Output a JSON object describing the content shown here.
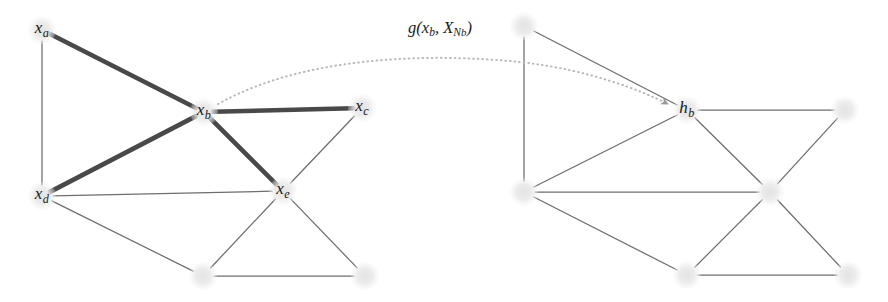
{
  "figure": {
    "title_caption": "",
    "background_color": "#ffffff",
    "node_fill_color": "#e8e8e8",
    "edge_color": "#555555",
    "highlight_edge_color": "#3a3a3a",
    "arrow_color": "#b8b8b8",
    "label_color": "#181818"
  },
  "annotation": {
    "formula_plain": "g(x_b, X_{N_b})",
    "g": "g",
    "open_paren": "(",
    "x": "x",
    "sub_b1": "b",
    "comma": ", ",
    "X": "X",
    "cal_N": "N",
    "sub_b2": "b",
    "close_paren": ")",
    "position": {
      "x": 440,
      "y": 28
    }
  },
  "left_graph": {
    "name": "input-graph",
    "nodes": [
      {
        "id": "xa",
        "label_base": "x",
        "label_sub": "a",
        "labeled": true,
        "x": 42,
        "y": 30,
        "r": 14
      },
      {
        "id": "xb",
        "label_base": "x",
        "label_sub": "b",
        "labeled": true,
        "x": 204,
        "y": 112,
        "r": 14
      },
      {
        "id": "xc",
        "label_base": "x",
        "label_sub": "c",
        "labeled": true,
        "x": 362,
        "y": 108,
        "r": 14
      },
      {
        "id": "xd",
        "label_base": "x",
        "label_sub": "d",
        "labeled": true,
        "x": 42,
        "y": 196,
        "r": 14
      },
      {
        "id": "xe",
        "label_base": "x",
        "label_sub": "e",
        "labeled": true,
        "x": 283,
        "y": 191,
        "r": 14
      },
      {
        "id": "u1",
        "label_base": "",
        "label_sub": "",
        "labeled": false,
        "x": 203,
        "y": 276,
        "r": 14
      },
      {
        "id": "u2",
        "label_base": "",
        "label_sub": "",
        "labeled": false,
        "x": 365,
        "y": 276,
        "r": 14
      }
    ],
    "edges": [
      {
        "from": "xa",
        "to": "xd",
        "highlight": false
      },
      {
        "from": "xa",
        "to": "xb",
        "highlight": true
      },
      {
        "from": "xd",
        "to": "xb",
        "highlight": true
      },
      {
        "from": "xb",
        "to": "xc",
        "highlight": true
      },
      {
        "from": "xb",
        "to": "xe",
        "highlight": true
      },
      {
        "from": "xd",
        "to": "xe",
        "highlight": false
      },
      {
        "from": "xc",
        "to": "xe",
        "highlight": false
      },
      {
        "from": "xd",
        "to": "u1",
        "highlight": false
      },
      {
        "from": "u1",
        "to": "xe",
        "highlight": false
      },
      {
        "from": "xe",
        "to": "u2",
        "highlight": false
      },
      {
        "from": "u1",
        "to": "u2",
        "highlight": false
      }
    ]
  },
  "right_graph": {
    "name": "output-embedding-graph",
    "nodes": [
      {
        "id": "ra",
        "label_base": "",
        "label_sub": "",
        "labeled": false,
        "x": 524,
        "y": 26,
        "r": 14
      },
      {
        "id": "hb",
        "label_base": "h",
        "label_sub": "b",
        "labeled": true,
        "x": 687,
        "y": 110,
        "r": 14
      },
      {
        "id": "rc",
        "label_base": "",
        "label_sub": "",
        "labeled": false,
        "x": 845,
        "y": 110,
        "r": 14
      },
      {
        "id": "rd",
        "label_base": "",
        "label_sub": "",
        "labeled": false,
        "x": 524,
        "y": 192,
        "r": 14
      },
      {
        "id": "re",
        "label_base": "",
        "label_sub": "",
        "labeled": false,
        "x": 770,
        "y": 192,
        "r": 14
      },
      {
        "id": "v1",
        "label_base": "",
        "label_sub": "",
        "labeled": false,
        "x": 687,
        "y": 275,
        "r": 14
      },
      {
        "id": "v2",
        "label_base": "",
        "label_sub": "",
        "labeled": false,
        "x": 848,
        "y": 275,
        "r": 14
      }
    ],
    "edges": [
      {
        "from": "ra",
        "to": "rd",
        "highlight": false
      },
      {
        "from": "ra",
        "to": "hb",
        "highlight": false
      },
      {
        "from": "rd",
        "to": "hb",
        "highlight": false
      },
      {
        "from": "hb",
        "to": "rc",
        "highlight": false
      },
      {
        "from": "hb",
        "to": "re",
        "highlight": false
      },
      {
        "from": "rd",
        "to": "re",
        "highlight": false
      },
      {
        "from": "rc",
        "to": "re",
        "highlight": false
      },
      {
        "from": "rd",
        "to": "v1",
        "highlight": false
      },
      {
        "from": "v1",
        "to": "re",
        "highlight": false
      },
      {
        "from": "re",
        "to": "v2",
        "highlight": false
      },
      {
        "from": "v1",
        "to": "v2",
        "highlight": false
      }
    ]
  },
  "mapping_arrow": {
    "name": "aggregation-arrow",
    "style": "dotted-curved-arrow",
    "from_node": "xb",
    "to_node": "hb",
    "path": "M 218 104 C 300 58, 420 52, 520 62 C 590 70, 640 90, 668 104"
  }
}
